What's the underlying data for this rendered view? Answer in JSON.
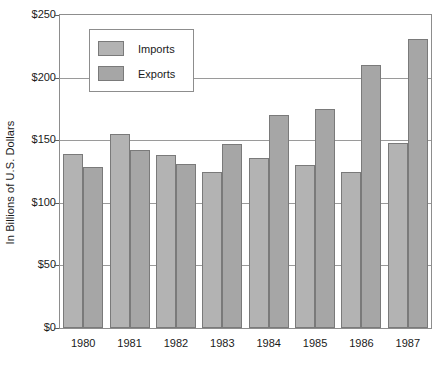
{
  "chart_data": {
    "type": "bar",
    "title": "",
    "subtitle": "",
    "xlabel": "",
    "ylabel": "In Billions of U.S. Dollars",
    "categories": [
      "1980",
      "1981",
      "1982",
      "1983",
      "1984",
      "1985",
      "1986",
      "1987"
    ],
    "series": [
      {
        "name": "Imports",
        "color": "#b3b3b3",
        "values": [
          139,
          155,
          138,
          125,
          136,
          130,
          125,
          148
        ]
      },
      {
        "name": "Exports",
        "color": "#a6a6a6",
        "values": [
          129,
          142,
          131,
          147,
          170,
          175,
          210,
          231
        ]
      }
    ],
    "ylim": [
      0,
      250
    ],
    "yticks": [
      0,
      50,
      100,
      150,
      200,
      250
    ],
    "ytick_labels": [
      "$0",
      "$50",
      "$100",
      "$150",
      "$200",
      "$250"
    ],
    "grid": true,
    "legend_position": "upper-left-inside",
    "annotations": []
  }
}
